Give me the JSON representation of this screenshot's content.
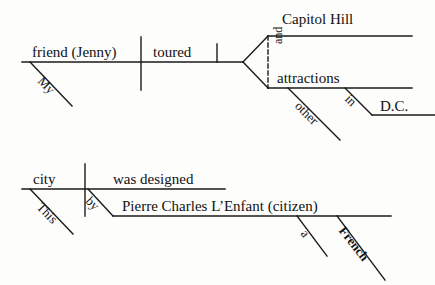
{
  "figure": {
    "kind": "reed-kellogg-sentence-diagram",
    "stroke_color": "#1a1a1a",
    "background_color": "#fdfdfc"
  },
  "diagrams": [
    {
      "id": "sentence-1",
      "sentence": "My friend (Jenny) toured Capitol Hill and other attractions in D.C.",
      "subject": "friend (Jenny)",
      "subject_plain": "friend",
      "subject_appositive": "Jenny",
      "verb": "toured",
      "modifiers": [
        {
          "word": "My",
          "attaches_to": "friend"
        },
        {
          "word": "other",
          "attaches_to": "attractions"
        }
      ],
      "compound_object": {
        "conjunction": "and",
        "items": [
          "Capitol Hill",
          "attractions"
        ]
      },
      "prepositional_phrase": {
        "preposition": "in",
        "object": "D.C."
      },
      "labels": {
        "subject": "friend (",
        "subject_appositive_bold": "Jenny",
        "subject_close": ")",
        "verb": "toured",
        "object_1": "Capitol Hill",
        "object_2": "attractions",
        "conjunction": "and",
        "mod_my": "My",
        "mod_other": "other",
        "prep": "in",
        "prep_object": "D.C."
      }
    },
    {
      "id": "sentence-2",
      "sentence": "This city was designed by Pierre Charles L'Enfant (a French citizen).",
      "subject": "city",
      "verb": "was designed",
      "prepositional_phrase": {
        "preposition": "by",
        "object": "Pierre Charles L'Enfant (citizen)"
      },
      "modifiers": [
        {
          "word": "This",
          "attaches_to": "city"
        },
        {
          "word": "a",
          "attaches_to": "citizen"
        },
        {
          "word": "French",
          "attaches_to": "citizen"
        }
      ],
      "labels": {
        "subject": "city",
        "verb": "was designed",
        "prep": "by",
        "prep_object": "Pierre Charles L’Enfant (",
        "prep_object_bold": "citizen",
        "prep_object_close": ")",
        "mod_this": "This",
        "mod_a": "a",
        "mod_french": "French"
      }
    }
  ]
}
